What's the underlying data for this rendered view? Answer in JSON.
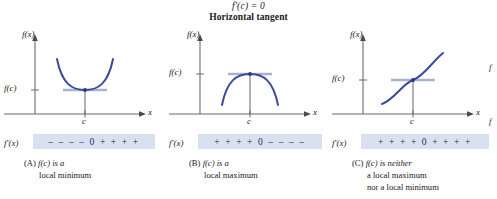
{
  "header": {
    "line1_prefix": "f",
    "line1_prime": "′",
    "line1_rest": "(c) = 0",
    "line1_full": "f′(c) = 0",
    "line2": "Horizontal tangent"
  },
  "axis_labels": {
    "y_top": "f(x)",
    "y_value": "f(c)",
    "x_right": "x",
    "x_tick": "c",
    "deriv_label": "f′(x)"
  },
  "panels": [
    {
      "id": "A",
      "curve_type": "parabola-up",
      "tangent": "horizontal",
      "sign_string": "– – – – 0 + + + +",
      "sign_left": "– – – –",
      "sign_zero": "0",
      "sign_right": "+ + + +",
      "caption_label": "(A)",
      "caption_line1": "f(c) is a",
      "caption_line2": "local minimum",
      "caption_line3": ""
    },
    {
      "id": "B",
      "curve_type": "parabola-down",
      "tangent": "horizontal",
      "sign_string": "+ + + + 0 – – – –",
      "sign_left": "+ + + +",
      "sign_zero": "0",
      "sign_right": "– – – –",
      "caption_label": "(B)",
      "caption_line1": "f(c) is a",
      "caption_line2": "local maximum",
      "caption_line3": ""
    },
    {
      "id": "C",
      "curve_type": "cubic-inflection",
      "tangent": "horizontal",
      "sign_string": "+ + + + 0 + + + +",
      "sign_left": "+ + + +",
      "sign_zero": "0",
      "sign_right": "+ + + +",
      "caption_label": "(C)",
      "caption_line1": "f(c) is neither",
      "caption_line2": "a local maximum",
      "caption_line3": "nor a local minimum"
    }
  ],
  "edge_fragments": {
    "frag1": "f",
    "frag2": "f"
  },
  "colors": {
    "curve": "#3a4a9f",
    "axis": "#6b6b6b",
    "band_bg": "#d9e1f0",
    "sign_text": "#1d2a5c",
    "tangent": "#a8b4cf",
    "text": "#1a1a1a"
  }
}
